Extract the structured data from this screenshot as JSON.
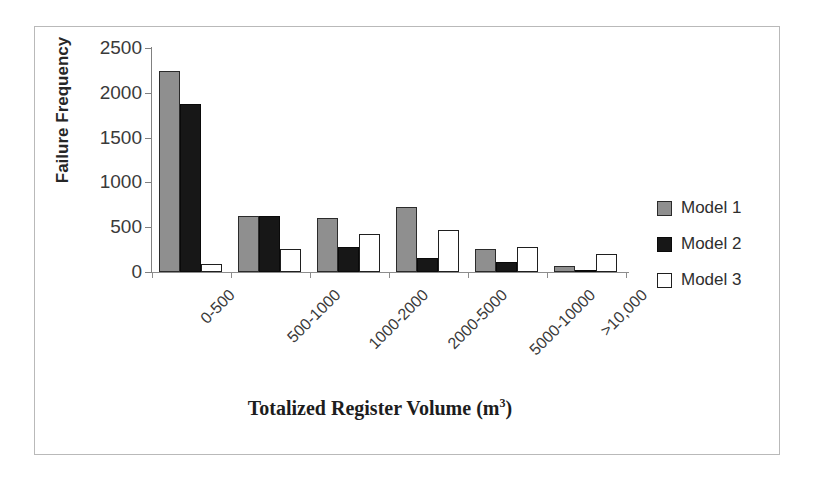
{
  "chart_data": {
    "type": "bar",
    "title": "",
    "xlabel": "Totalized Register Volume (m³)",
    "xlabel_base": "Totalized Register Volume (m",
    "xlabel_sup": "3",
    "xlabel_tail": ")",
    "ylabel": "Failure Frequency",
    "categories": [
      "0-500",
      "500-1000",
      "1000-2000",
      "2000-5000",
      "5000-10000",
      ">10,000"
    ],
    "series": [
      {
        "name": "Model 1",
        "color": "#8f8f8f",
        "values": [
          2240,
          625,
          600,
          730,
          255,
          70
        ]
      },
      {
        "name": "Model 2",
        "color": "#171717",
        "values": [
          1870,
          625,
          275,
          155,
          110,
          25
        ]
      },
      {
        "name": "Model 3",
        "color": "#ffffff",
        "values": [
          90,
          255,
          425,
          465,
          280,
          205
        ]
      }
    ],
    "ylim": [
      0,
      2500
    ],
    "ytick_labels": [
      "2500",
      "2000",
      "1500",
      "1000",
      "500",
      "0"
    ],
    "ytick_values": [
      2500,
      2000,
      1500,
      1000,
      500,
      0
    ],
    "grid": false,
    "legend_position": "right"
  },
  "legend": {
    "items": [
      {
        "label": "Model 1",
        "swatch": "gray-filled-square"
      },
      {
        "label": "Model 2",
        "swatch": "black-filled-square"
      },
      {
        "label": "Model 3",
        "swatch": "white-outlined-square"
      }
    ]
  }
}
